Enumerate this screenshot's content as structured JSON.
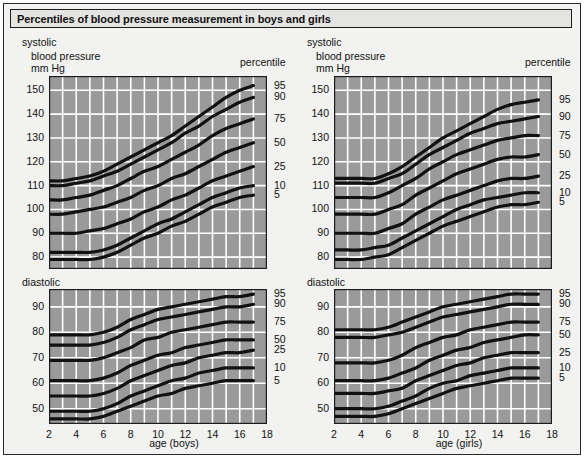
{
  "title": "Percentiles of blood pressure measurement in boys and girls",
  "labels": {
    "systolic": "systolic",
    "blood_pressure": "blood pressure",
    "mm_hg": "mm Hg",
    "percentile": "percentile",
    "diastolic": "diastolic",
    "xaxis_boys": "age (boys)",
    "xaxis_girls": "age (girls)"
  },
  "percentile_labels": [
    "95",
    "90",
    "75",
    "50",
    "25",
    "10",
    "5"
  ],
  "colors": {
    "plot_background": "#9a9a9a",
    "gridline": "#ffffff",
    "curve": "#111111",
    "frame": "#1d1d1d",
    "page_background": "#f2f2f0",
    "title_background": "#e4e4e2",
    "text": "#101010"
  },
  "chart_data": [
    {
      "id": "systolic-boys",
      "type": "line",
      "title": "systolic",
      "xlabel": "age (boys)",
      "ylabel": "blood pressure mm Hg",
      "xlim": [
        2,
        18
      ],
      "ylim": [
        75,
        156
      ],
      "xticks": [
        2,
        4,
        6,
        8,
        10,
        12,
        14,
        16,
        18
      ],
      "yticks": [
        80,
        90,
        100,
        110,
        120,
        130,
        140,
        150
      ],
      "grid": true,
      "legend_position": "right",
      "x": [
        2,
        3,
        4,
        5,
        6,
        7,
        8,
        9,
        10,
        11,
        12,
        13,
        14,
        15,
        16,
        17
      ],
      "series": [
        {
          "name": "95",
          "values": [
            112,
            112,
            113,
            114,
            116,
            119,
            122,
            125,
            128,
            131,
            135,
            139,
            143,
            147,
            150,
            152
          ]
        },
        {
          "name": "90",
          "values": [
            110,
            110,
            111,
            112,
            114,
            116,
            119,
            122,
            125,
            128,
            132,
            135,
            139,
            142,
            145,
            147
          ]
        },
        {
          "name": "75",
          "values": [
            104,
            104,
            105,
            106,
            108,
            110,
            113,
            116,
            118,
            121,
            124,
            127,
            131,
            134,
            136,
            138
          ]
        },
        {
          "name": "50",
          "values": [
            98,
            98,
            99,
            100,
            101,
            103,
            105,
            108,
            110,
            113,
            115,
            118,
            121,
            124,
            126,
            128
          ]
        },
        {
          "name": "25",
          "values": [
            90,
            90,
            90,
            91,
            92,
            94,
            96,
            99,
            101,
            104,
            106,
            109,
            112,
            114,
            116,
            118
          ]
        },
        {
          "name": "10",
          "values": [
            82,
            82,
            82,
            82,
            83,
            85,
            88,
            91,
            94,
            96,
            99,
            102,
            105,
            107,
            109,
            110
          ]
        },
        {
          "name": "5",
          "values": [
            79,
            79,
            79,
            79,
            80,
            82,
            85,
            88,
            90,
            93,
            95,
            98,
            101,
            103,
            105,
            106
          ]
        }
      ]
    },
    {
      "id": "systolic-girls",
      "type": "line",
      "title": "systolic",
      "xlabel": "age (girls)",
      "ylabel": "blood pressure mm Hg",
      "xlim": [
        2,
        18
      ],
      "ylim": [
        75,
        156
      ],
      "xticks": [
        2,
        4,
        6,
        8,
        10,
        12,
        14,
        16,
        18
      ],
      "yticks": [
        80,
        90,
        100,
        110,
        120,
        130,
        140,
        150
      ],
      "grid": true,
      "legend_position": "right",
      "x": [
        2,
        3,
        4,
        5,
        6,
        7,
        8,
        9,
        10,
        11,
        12,
        13,
        14,
        15,
        16,
        17
      ],
      "series": [
        {
          "name": "95",
          "values": [
            113,
            113,
            113,
            113,
            115,
            118,
            122,
            126,
            130,
            133,
            136,
            139,
            142,
            144,
            145,
            146
          ]
        },
        {
          "name": "90",
          "values": [
            111,
            111,
            111,
            111,
            113,
            115,
            119,
            123,
            126,
            129,
            132,
            134,
            136,
            137,
            138,
            139
          ]
        },
        {
          "name": "75",
          "values": [
            105,
            105,
            105,
            105,
            107,
            110,
            113,
            117,
            120,
            123,
            125,
            127,
            129,
            130,
            131,
            131
          ]
        },
        {
          "name": "50",
          "values": [
            98,
            98,
            98,
            98,
            100,
            102,
            106,
            109,
            112,
            115,
            117,
            119,
            121,
            122,
            122,
            123
          ]
        },
        {
          "name": "25",
          "values": [
            90,
            90,
            90,
            90,
            92,
            94,
            98,
            101,
            104,
            106,
            108,
            110,
            112,
            113,
            113,
            114
          ]
        },
        {
          "name": "10",
          "values": [
            83,
            83,
            83,
            84,
            85,
            88,
            91,
            94,
            97,
            100,
            102,
            104,
            105,
            106,
            107,
            107
          ]
        },
        {
          "name": "5",
          "values": [
            79,
            79,
            79,
            80,
            81,
            84,
            87,
            90,
            93,
            95,
            97,
            99,
            101,
            102,
            102,
            103
          ]
        }
      ]
    },
    {
      "id": "diastolic-boys",
      "type": "line",
      "title": "diastolic",
      "xlabel": "age (boys)",
      "ylabel": "",
      "xlim": [
        2,
        18
      ],
      "ylim": [
        44,
        97
      ],
      "xticks": [
        2,
        4,
        6,
        8,
        10,
        12,
        14,
        16,
        18
      ],
      "yticks": [
        50,
        60,
        70,
        80,
        90
      ],
      "grid": true,
      "legend_position": "right",
      "x": [
        2,
        3,
        4,
        5,
        6,
        7,
        8,
        9,
        10,
        11,
        12,
        13,
        14,
        15,
        16,
        17
      ],
      "series": [
        {
          "name": "95",
          "values": [
            79,
            79,
            79,
            79,
            80,
            82,
            85,
            87,
            89,
            90,
            91,
            92,
            93,
            94,
            94,
            95
          ]
        },
        {
          "name": "90",
          "values": [
            75,
            75,
            75,
            75,
            76,
            78,
            81,
            83,
            85,
            86,
            87,
            88,
            89,
            90,
            90,
            91
          ]
        },
        {
          "name": "75",
          "values": [
            69,
            69,
            69,
            69,
            70,
            72,
            74,
            77,
            78,
            80,
            81,
            82,
            83,
            84,
            84,
            84
          ]
        },
        {
          "name": "50",
          "values": [
            61,
            61,
            61,
            61,
            62,
            64,
            67,
            69,
            71,
            72,
            74,
            75,
            76,
            77,
            77,
            77
          ]
        },
        {
          "name": "25",
          "values": [
            55,
            55,
            55,
            55,
            56,
            58,
            61,
            63,
            65,
            67,
            68,
            70,
            71,
            72,
            72,
            73
          ]
        },
        {
          "name": "10",
          "values": [
            49,
            49,
            49,
            49,
            50,
            52,
            55,
            57,
            59,
            61,
            62,
            64,
            65,
            66,
            66,
            66
          ]
        },
        {
          "name": "5",
          "values": [
            46,
            46,
            46,
            46,
            47,
            49,
            51,
            53,
            55,
            56,
            58,
            59,
            60,
            61,
            61,
            61
          ]
        }
      ]
    },
    {
      "id": "diastolic-girls",
      "type": "line",
      "title": "diastolic",
      "xlabel": "age (girls)",
      "ylabel": "",
      "xlim": [
        2,
        18
      ],
      "ylim": [
        44,
        97
      ],
      "xticks": [
        2,
        4,
        6,
        8,
        10,
        12,
        14,
        16,
        18
      ],
      "yticks": [
        50,
        60,
        70,
        80,
        90
      ],
      "grid": true,
      "legend_position": "right",
      "x": [
        2,
        3,
        4,
        5,
        6,
        7,
        8,
        9,
        10,
        11,
        12,
        13,
        14,
        15,
        16,
        17
      ],
      "series": [
        {
          "name": "95",
          "values": [
            81,
            81,
            81,
            81,
            82,
            84,
            86,
            88,
            90,
            91,
            92,
            93,
            94,
            95,
            95,
            95
          ]
        },
        {
          "name": "90",
          "values": [
            78,
            78,
            78,
            78,
            79,
            80,
            82,
            84,
            86,
            87,
            88,
            89,
            90,
            91,
            91,
            91
          ]
        },
        {
          "name": "75",
          "values": [
            68,
            68,
            68,
            68,
            69,
            71,
            74,
            76,
            78,
            79,
            81,
            82,
            83,
            84,
            84,
            84
          ]
        },
        {
          "name": "50",
          "values": [
            61,
            61,
            61,
            61,
            62,
            64,
            66,
            69,
            71,
            73,
            74,
            76,
            77,
            78,
            79,
            79
          ]
        },
        {
          "name": "25",
          "values": [
            56,
            56,
            56,
            56,
            57,
            58,
            61,
            63,
            65,
            67,
            68,
            70,
            71,
            72,
            72,
            72
          ]
        },
        {
          "name": "10",
          "values": [
            50,
            50,
            50,
            50,
            51,
            53,
            55,
            58,
            60,
            61,
            63,
            64,
            65,
            66,
            66,
            66
          ]
        },
        {
          "name": "5",
          "values": [
            47,
            47,
            47,
            47,
            48,
            50,
            52,
            54,
            56,
            58,
            59,
            60,
            61,
            62,
            62,
            62
          ]
        }
      ]
    }
  ]
}
